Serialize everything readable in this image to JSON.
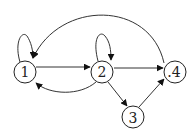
{
  "diagram": {
    "type": "directed-graph",
    "nodes": [
      {
        "id": "1",
        "label": "1",
        "x": 25,
        "y": 72
      },
      {
        "id": "2",
        "label": "2",
        "x": 102,
        "y": 72
      },
      {
        "id": "3",
        "label": "3",
        "x": 133,
        "y": 117
      },
      {
        "id": "4",
        "label": ".4",
        "x": 175,
        "y": 72
      }
    ],
    "edges": [
      {
        "from": "1",
        "to": "1",
        "kind": "self-loop"
      },
      {
        "from": "2",
        "to": "2",
        "kind": "self-loop"
      },
      {
        "from": "1",
        "to": "2",
        "kind": "straight"
      },
      {
        "from": "2",
        "to": "1",
        "kind": "curved-below"
      },
      {
        "from": "2",
        "to": "4",
        "kind": "straight"
      },
      {
        "from": "2",
        "to": "3",
        "kind": "straight"
      },
      {
        "from": "3",
        "to": "4",
        "kind": "straight"
      },
      {
        "from": "4",
        "to": "1",
        "kind": "curved-above"
      }
    ],
    "colors": {
      "stroke": "#222222",
      "background": "#ffffff"
    }
  }
}
